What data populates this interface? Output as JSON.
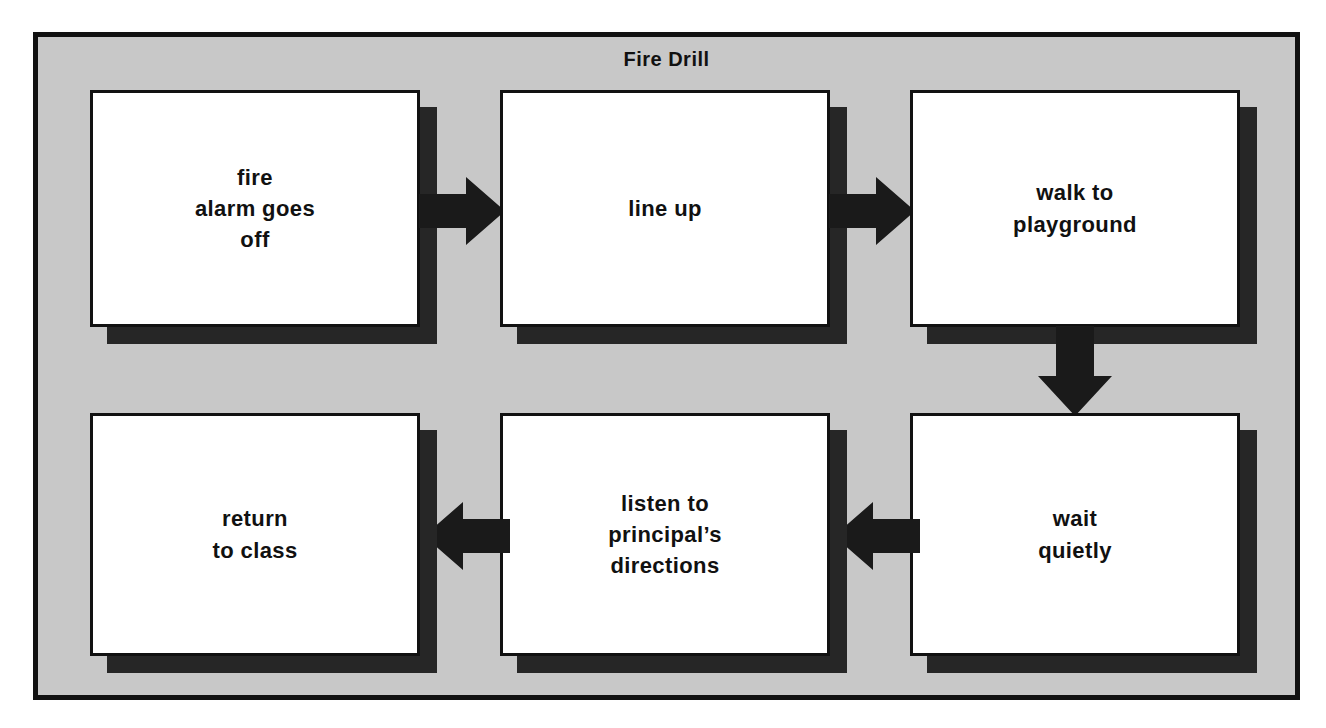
{
  "poster": {
    "title": "Fire Drill",
    "background_color": "#c8c8c8",
    "border_color": "#111111",
    "box_fill_color": "#ffffff",
    "shadow_color": "#262626",
    "arrow_color": "#1a1a1a"
  },
  "steps": [
    {
      "id": "step-1",
      "order": 1,
      "label": "fire\nalarm goes\noff"
    },
    {
      "id": "step-2",
      "order": 2,
      "label": "line up"
    },
    {
      "id": "step-3",
      "order": 3,
      "label": "walk to\nplayground"
    },
    {
      "id": "step-4",
      "order": 4,
      "label": "wait\nquietly"
    },
    {
      "id": "step-5",
      "order": 5,
      "label": "listen to\nprincipal’s\ndirections"
    },
    {
      "id": "step-6",
      "order": 6,
      "label": "return\nto class"
    }
  ],
  "arrows": [
    {
      "id": "arrow-1",
      "direction": "right",
      "from": "step-1",
      "to": "step-2"
    },
    {
      "id": "arrow-2",
      "direction": "right",
      "from": "step-2",
      "to": "step-3"
    },
    {
      "id": "arrow-3",
      "direction": "down",
      "from": "step-3",
      "to": "step-4"
    },
    {
      "id": "arrow-4",
      "direction": "left",
      "from": "step-4",
      "to": "step-5"
    },
    {
      "id": "arrow-5",
      "direction": "left",
      "from": "step-5",
      "to": "step-6"
    }
  ]
}
